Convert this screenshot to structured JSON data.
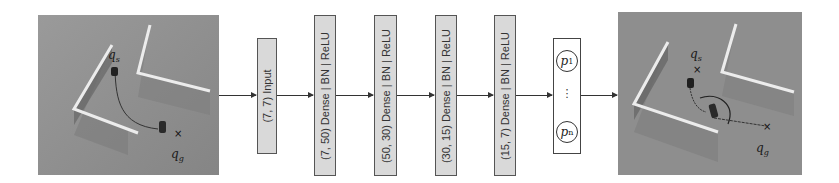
{
  "diagram": {
    "input_scene": {
      "start_label": "q_s",
      "goal_label": "q_g",
      "description": "Robot top-down scene with two L-shaped walls, path from start to goal"
    },
    "layers": [
      {
        "label": "(7, 7) Input"
      },
      {
        "label": "(7, 50) Dense | BN | ReLU"
      },
      {
        "label": "(50, 30) Dense | BN | ReLU"
      },
      {
        "label": "(30, 15) Dense | BN | ReLU"
      },
      {
        "label": "(15, 7) Dense | BN | ReLU"
      }
    ],
    "output": {
      "first_node": "p",
      "first_sub": "1",
      "ellipsis": "⋮",
      "last_node": "p",
      "last_sub": "n"
    },
    "output_scene": {
      "start_label": "q_s",
      "goal_label": "q_g",
      "description": "Robot scene with predicted trajectory from start to goal"
    },
    "colors": {
      "scene_bg": "#8f8f8f",
      "wall": "#e8e8e8",
      "layer_fill": "#d9d9d9",
      "arrow": "#333333"
    }
  }
}
